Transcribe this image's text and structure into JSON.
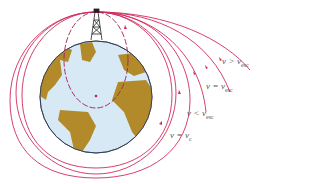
{
  "colors": {
    "trajectory": "#d12a5c",
    "ocean": "#d6e9f5",
    "land": "#b38a2a",
    "earth_outline": "#2a3550",
    "tower": "#222222",
    "label": "#555555"
  },
  "labels": [
    {
      "id": "v-greater-vesc",
      "var": "v",
      "op": ">",
      "rhs": "v",
      "sub": "esc"
    },
    {
      "id": "v-equal-vesc",
      "var": "v",
      "op": "=",
      "rhs": "v",
      "sub": "esc"
    },
    {
      "id": "v-less-vesc",
      "var": "v",
      "op": "<",
      "rhs": "v",
      "sub": "esc"
    },
    {
      "id": "v-equal-vc",
      "var": "v",
      "op": "=",
      "rhs": "v",
      "sub": "c"
    }
  ],
  "elements": {
    "earth": "Earth globe (Atlantic view)",
    "tower": "launch tower",
    "center": "Earth center point",
    "inner_orbit": "dashed elliptical sub-orbital path"
  }
}
